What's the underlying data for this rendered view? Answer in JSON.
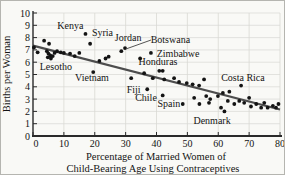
{
  "figure": {
    "ylabel": "Births per Woman",
    "xlabel_line1": "Percentage of Married Women of",
    "xlabel_line2": "Child-Bearing Age Using Contraceptives"
  },
  "chart_data": {
    "type": "scatter",
    "title": "",
    "xlabel": "Percentage of Married Women of Child-Bearing Age Using Contraceptives",
    "ylabel": "Births per Woman",
    "xlim": [
      0,
      80
    ],
    "ylim": [
      0,
      10
    ],
    "xticks": [
      0,
      10,
      20,
      30,
      40,
      50,
      60,
      70,
      80
    ],
    "yticks": [
      0,
      1,
      2,
      3,
      4,
      5,
      6,
      7,
      8,
      9,
      10
    ],
    "grid": true,
    "legend": "none",
    "points": [
      [
        0.3,
        7.2
      ],
      [
        1.5,
        6.8
      ],
      [
        3.6,
        7.75
      ],
      [
        5.2,
        7.5
      ],
      [
        4.5,
        6.9
      ],
      [
        5.0,
        6.7
      ],
      [
        5.6,
        6.55
      ],
      [
        4.8,
        6.4
      ],
      [
        5.8,
        6.3
      ],
      [
        6.4,
        6.5
      ],
      [
        7.0,
        6.75
      ],
      [
        7.8,
        6.9
      ],
      [
        9.0,
        6.8
      ],
      [
        10.0,
        6.75
      ],
      [
        12.0,
        6.7
      ],
      [
        13.5,
        6.5
      ],
      [
        15.0,
        6.75
      ],
      [
        17.0,
        8.3
      ],
      [
        18.5,
        7.5
      ],
      [
        19.5,
        5.2
      ],
      [
        21.5,
        6.1
      ],
      [
        23.5,
        6.3
      ],
      [
        24.5,
        6.45
      ],
      [
        28.6,
        6.9
      ],
      [
        29.8,
        7.15
      ],
      [
        31.8,
        4.7
      ],
      [
        34.7,
        6.3
      ],
      [
        36.0,
        5.1
      ],
      [
        38.2,
        6.75
      ],
      [
        37.0,
        3.8
      ],
      [
        38.8,
        4.7
      ],
      [
        40.9,
        5.3
      ],
      [
        42.0,
        5.3
      ],
      [
        42.0,
        3.3
      ],
      [
        42.5,
        4.6
      ],
      [
        45.7,
        4.7
      ],
      [
        47.3,
        4.4
      ],
      [
        48.5,
        2.6
      ],
      [
        49.8,
        4.3
      ],
      [
        51.7,
        4.2
      ],
      [
        52.2,
        3.1
      ],
      [
        53.8,
        4.1
      ],
      [
        53.9,
        2.6
      ],
      [
        55.4,
        4.6
      ],
      [
        56.1,
        3.25
      ],
      [
        57.0,
        2.7
      ],
      [
        57.4,
        3.0
      ],
      [
        59.9,
        3.25
      ],
      [
        60.9,
        2.3
      ],
      [
        62.0,
        2.0
      ],
      [
        61.5,
        3.5
      ],
      [
        63.1,
        2.85
      ],
      [
        63.6,
        3.6
      ],
      [
        65.2,
        2.6
      ],
      [
        66.8,
        2.85
      ],
      [
        67.4,
        4.1
      ],
      [
        68.4,
        2.7
      ],
      [
        70.0,
        3.1
      ],
      [
        70.6,
        2.4
      ],
      [
        72.3,
        2.6
      ],
      [
        73.9,
        2.3
      ],
      [
        74.9,
        2.7
      ],
      [
        76.0,
        2.3
      ],
      [
        77.7,
        2.45
      ],
      [
        78.7,
        2.3
      ],
      [
        79.5,
        2.6
      ]
    ],
    "annotations": [
      {
        "text": "Kenya",
        "x": 12.1,
        "y": 9.0,
        "dot": [
          17.0,
          8.3
        ]
      },
      {
        "text": "Syria",
        "x": 22.5,
        "y": 8.35,
        "dot": [
          18.5,
          7.5
        ]
      },
      {
        "text": "Jordan",
        "x": 30.8,
        "y": 7.97,
        "dot": [
          28.6,
          6.9
        ]
      },
      {
        "text": "Botswana",
        "x": 44.5,
        "y": 7.85,
        "dot": [
          29.8,
          7.15
        ]
      },
      {
        "text": "Zimbabwe",
        "x": 47.0,
        "y": 6.72,
        "dot": [
          38.2,
          6.75
        ]
      },
      {
        "text": "Honduras",
        "x": 40.5,
        "y": 6.02,
        "dot": [
          34.7,
          6.3
        ]
      },
      {
        "text": "Lesotho",
        "x": 7.4,
        "y": 5.6,
        "dot": [
          5.8,
          6.3
        ]
      },
      {
        "text": "Vietnam",
        "x": 19.1,
        "y": 4.72,
        "dot": [
          19.5,
          5.2
        ]
      },
      {
        "text": "Costa Rica",
        "x": 68.0,
        "y": 4.72,
        "dot": [
          67.4,
          4.1
        ]
      },
      {
        "text": "Fiji",
        "x": 32.6,
        "y": 3.74,
        "dot": [
          37.0,
          3.8
        ]
      },
      {
        "text": "Chile",
        "x": 36.6,
        "y": 3.08,
        "dot": [
          42.0,
          3.3
        ]
      },
      {
        "text": "Spain",
        "x": 44.0,
        "y": 2.6,
        "dot": [
          48.5,
          2.6
        ]
      },
      {
        "text": "Denmark",
        "x": 58.0,
        "y": 1.22,
        "dot": [
          62.0,
          2.0
        ]
      }
    ],
    "trend_line": {
      "x1": 0,
      "y1": 7.35,
      "x2": 80,
      "y2": 2.15
    },
    "leader_line": {
      "for_label": "Botswana",
      "x1": 30.4,
      "y1": 7.1,
      "x2": 38.2,
      "y2": 7.8
    },
    "colors": {
      "point": "#141414",
      "trend": "#4d4d4d",
      "grid": "#d9d9d4",
      "axis": "#2a2a2a",
      "text": "#141414",
      "background": "#f9f9f6"
    }
  }
}
